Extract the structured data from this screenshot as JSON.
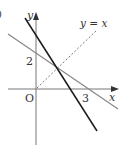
{
  "figure": {
    "part_label": ")",
    "axes": {
      "x_label": "x",
      "y_label": "y",
      "origin_label": "O"
    },
    "ticks": {
      "y_intercept_label": "2",
      "x_intercept_label": "3"
    },
    "lines": [
      {
        "name": "gray-line",
        "description": "line through (0,2) and (3,0)",
        "color": "#8a8a8a",
        "style": "solid"
      },
      {
        "name": "black-line",
        "description": "steeper line",
        "color": "#1a1a1a",
        "style": "solid"
      },
      {
        "name": "identity-line",
        "label": "y = x",
        "color": "#777777",
        "style": "dashed"
      }
    ],
    "identity_label": "y = x"
  }
}
